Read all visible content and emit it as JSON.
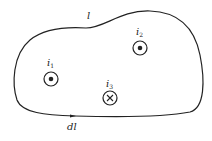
{
  "diagram": {
    "type": "closed-loop-with-currents",
    "loop_label": "l",
    "element_label": "dl",
    "currents": [
      {
        "name": "i",
        "sub": "1",
        "direction": "out-of-page",
        "symbol": "dot"
      },
      {
        "name": "i",
        "sub": "2",
        "direction": "out-of-page",
        "symbol": "dot"
      },
      {
        "name": "i",
        "sub": "3",
        "direction": "into-page",
        "symbol": "cross"
      }
    ],
    "colors": {
      "stroke": "#222222",
      "background": "#ffffff"
    }
  }
}
